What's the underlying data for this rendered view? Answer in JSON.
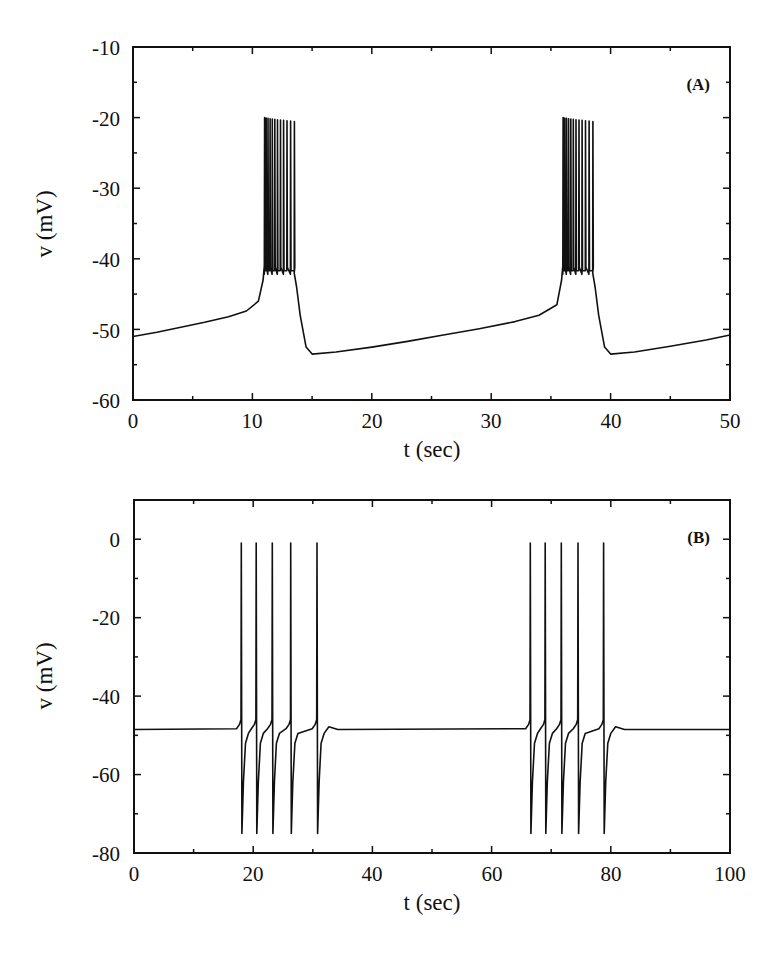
{
  "chart_data": [
    {
      "type": "line",
      "panel": "(A)",
      "title": "",
      "xlabel": "t (sec)",
      "ylabel": "v (mV)",
      "xlim": [
        0,
        50
      ],
      "ylim": [
        -60,
        -10
      ],
      "xticks": [
        0,
        10,
        20,
        30,
        40,
        50
      ],
      "yticks": [
        -60,
        -50,
        -40,
        -30,
        -20,
        -10
      ],
      "grid": false,
      "description": "Slow depolarizing ramp from about -51 mV rising to about -47 mV, then a burst of ~12 spikes peaking near -20 mV with troughs near -42 mV, followed by a drop to about -53.5 mV and slow recovery; repeats with period ~25 s.",
      "bursts": [
        {
          "start": 11.0,
          "end": 13.5,
          "spike_peak": -20,
          "spike_trough": -42,
          "n_spikes": 12
        },
        {
          "start": 36.0,
          "end": 38.5,
          "spike_peak": -20,
          "spike_trough": -42,
          "n_spikes": 12
        }
      ],
      "series": [
        {
          "name": "v",
          "x": [
            0,
            2,
            4,
            6,
            8,
            9.5,
            10.5,
            10.9,
            11.0,
            13.5,
            13.7,
            14.0,
            14.5,
            15.0,
            17,
            20,
            23,
            26,
            29,
            32,
            34,
            35.5,
            35.9,
            36.0,
            38.5,
            38.7,
            39.0,
            39.5,
            40.0,
            42,
            45,
            48,
            50
          ],
          "y": [
            -51.0,
            -50.4,
            -49.7,
            -49.0,
            -48.2,
            -47.4,
            -46.0,
            -43.0,
            -41.0,
            -42.0,
            -44.0,
            -48.0,
            -52.5,
            -53.5,
            -53.2,
            -52.5,
            -51.7,
            -50.8,
            -49.9,
            -48.9,
            -48.0,
            -46.5,
            -43.0,
            -41.0,
            -42.0,
            -44.0,
            -48.0,
            -52.5,
            -53.5,
            -53.2,
            -52.4,
            -51.5,
            -50.8
          ]
        }
      ]
    },
    {
      "type": "line",
      "panel": "(B)",
      "title": "",
      "xlabel": "t (sec)",
      "ylabel": "v (mV)",
      "xlim": [
        0,
        100
      ],
      "ylim": [
        -80,
        10
      ],
      "xticks": [
        0,
        20,
        40,
        60,
        80,
        100
      ],
      "yticks": [
        -80,
        -60,
        -40,
        -20,
        0
      ],
      "grid": false,
      "description": "Resting potential near -48.5 mV with two bursts of 5 spikes each; spikes peak near -1 mV and undershoot to about -75 mV.",
      "rest_potential": -48.5,
      "spike_peak": -1,
      "spike_trough": -75,
      "spike_times": [
        18.0,
        20.5,
        23.2,
        26.3,
        30.7,
        66.5,
        69.0,
        71.7,
        74.5,
        78.8
      ]
    }
  ],
  "panels": {
    "a": {
      "tag": "(A)",
      "xlabel": "t (sec)",
      "ylabel": "v (mV)",
      "xtick_labels": [
        "0",
        "10",
        "20",
        "30",
        "40",
        "50"
      ],
      "ytick_labels": [
        "-10",
        "-20",
        "-30",
        "-40",
        "-50",
        "-60"
      ]
    },
    "b": {
      "tag": "(B)",
      "xlabel": "t (sec)",
      "ylabel": "v (mV)",
      "xtick_labels": [
        "0",
        "20",
        "40",
        "60",
        "80",
        "100"
      ],
      "ytick_labels": [
        "0",
        "-20",
        "-40",
        "-60",
        "-80"
      ]
    }
  },
  "colors": {
    "line": "#111111",
    "background": "#ffffff"
  }
}
